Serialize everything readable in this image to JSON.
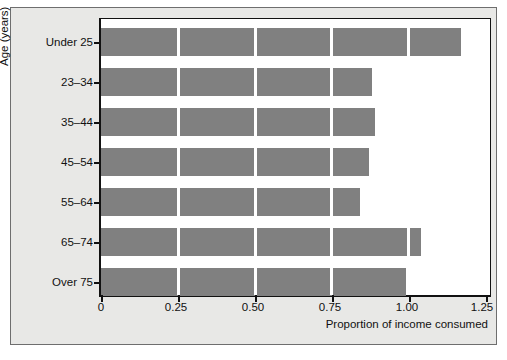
{
  "chart_data": {
    "type": "bar",
    "orientation": "horizontal",
    "title": "",
    "xlabel": "Proportion of income consumed",
    "ylabel": "Age (years)",
    "categories": [
      "Under 25",
      "23–34",
      "35–44",
      "45–54",
      "55–64",
      "65–74",
      "Over 75"
    ],
    "values": [
      1.17,
      0.88,
      0.89,
      0.87,
      0.84,
      1.04,
      0.99
    ],
    "xlim": [
      0,
      1.25
    ],
    "xticks": [
      0,
      0.25,
      0.5,
      0.75,
      1.0,
      1.25
    ],
    "xtick_labels": [
      "0",
      "0.25",
      "0.50",
      "0.75",
      "1.00",
      "1.25"
    ],
    "grid": "vertical-white-over-bars",
    "legend": null,
    "bar_color": "#808080",
    "plot_background": "#ffffff",
    "figure_background": "#e8e8e6",
    "axis_color": "#111111"
  },
  "axes": {
    "y_title": "Age (years)",
    "x_title": "Proportion of income consumed"
  }
}
